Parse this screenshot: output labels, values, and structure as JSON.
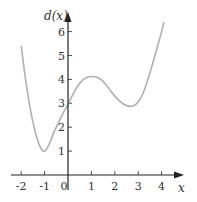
{
  "chart_data": {
    "type": "line",
    "title": "",
    "xlabel": "x",
    "ylabel": "d(x)",
    "xlim": [
      -2.5,
      4.6
    ],
    "ylim": [
      0,
      6.6
    ],
    "x_ticks": [
      -2,
      -1,
      0,
      1,
      2,
      3,
      4
    ],
    "x_tick_labels": [
      "-2",
      "-1",
      "0",
      "1",
      "2",
      "3",
      "4"
    ],
    "y_ticks": [
      1,
      2,
      3,
      4,
      5,
      6
    ],
    "y_tick_labels": [
      "1",
      "2",
      "3",
      "4",
      "5",
      "6"
    ],
    "grid": false,
    "series": [
      {
        "name": "d(x)",
        "color": "#b0b0b0",
        "x": [
          -2,
          -1.8,
          -1.6,
          -1.4,
          -1.2,
          -1.0,
          -0.8,
          -0.6,
          -0.4,
          -0.2,
          0,
          0.2,
          0.4,
          0.6,
          0.8,
          1.0,
          1.2,
          1.4,
          1.6,
          1.8,
          2.0,
          2.2,
          2.4,
          2.6,
          2.8,
          3.0,
          3.2,
          3.4,
          3.6,
          3.8,
          4.0,
          4.1
        ],
        "y": [
          5.4,
          3.9,
          2.7,
          1.8,
          1.2,
          1.0,
          1.3,
          1.8,
          2.2,
          2.6,
          2.95,
          3.35,
          3.7,
          3.95,
          4.08,
          4.12,
          4.1,
          4.0,
          3.8,
          3.55,
          3.3,
          3.1,
          2.95,
          2.88,
          2.9,
          3.05,
          3.4,
          3.95,
          4.6,
          5.3,
          6.0,
          6.4
        ]
      }
    ]
  }
}
